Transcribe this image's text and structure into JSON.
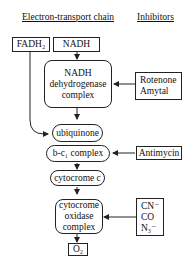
{
  "headers": {
    "left": "Electron-transport chain",
    "right": "Inhibitors"
  },
  "nodes": {
    "fadh2": "FADH₂",
    "nadh": "NADH",
    "nadh_dehydrogenase": [
      "NADH",
      "dehydrogenase",
      "complex"
    ],
    "ubiquinone": "ubiquinone",
    "bc1_complex": "b-c₁ complex",
    "cytochrome_c": "cytocrome c",
    "cytochrome_oxidase": [
      "cytocrome",
      "oxidase",
      "complex"
    ],
    "o2": "O₂"
  },
  "inhibitors": {
    "nadh_dehydrogenase": [
      "Rotenone",
      "Amytal"
    ],
    "bc1_complex": [
      "Antimycin"
    ],
    "cytochrome_oxidase": [
      "CN⁻",
      "CO",
      "N₃⁻"
    ]
  },
  "colors": {
    "line": "#222222",
    "background": "#ffffff"
  }
}
